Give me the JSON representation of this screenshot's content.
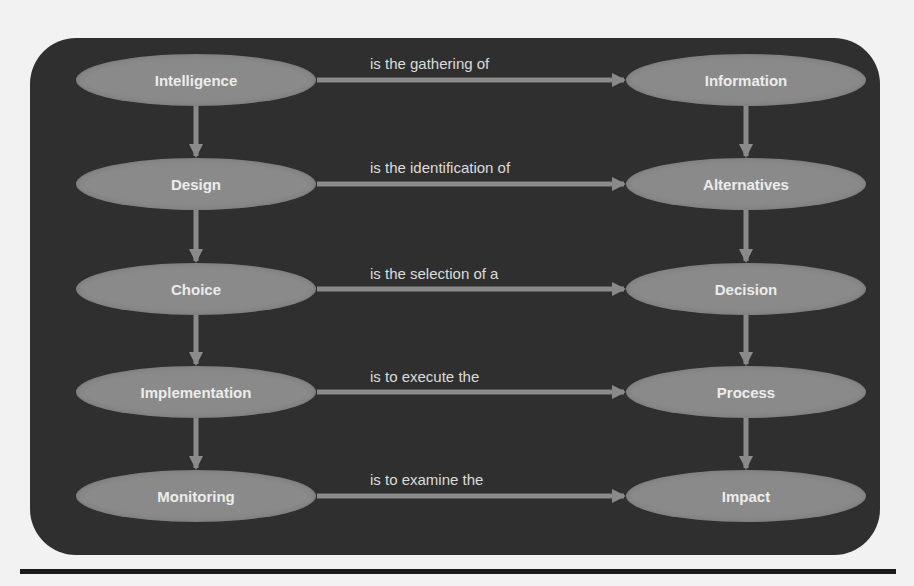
{
  "diagram": {
    "colors": {
      "panel": "#2f2f2f",
      "node": "#8a8a8a",
      "node_text": "#ececec",
      "arrow": "#8a8a8a",
      "label_text": "#dcdcdc",
      "page_background": "#f2f2f2",
      "rule": "#1a1a1a"
    },
    "rows": [
      {
        "phase": "Intelligence",
        "relation": "is the gathering of",
        "object": "Information"
      },
      {
        "phase": "Design",
        "relation": "is the identification of",
        "object": "Alternatives"
      },
      {
        "phase": "Choice",
        "relation": "is the selection of a",
        "object": "Decision"
      },
      {
        "phase": "Implementation",
        "relation": "is to execute the",
        "object": "Process"
      },
      {
        "phase": "Monitoring",
        "relation": "is to examine the",
        "object": "Impact"
      }
    ],
    "vertical_flow": {
      "left": [
        "Intelligence",
        "Design",
        "Choice",
        "Implementation",
        "Monitoring"
      ],
      "right": [
        "Information",
        "Alternatives",
        "Decision",
        "Process",
        "Impact"
      ]
    }
  }
}
